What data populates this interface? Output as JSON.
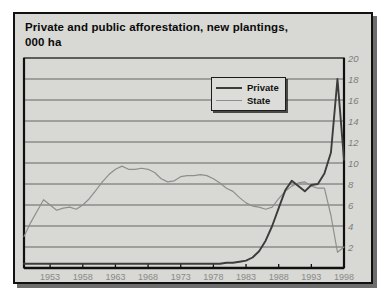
{
  "chart_title": "Private and public afforestation, new plantings,\n000 ha",
  "legend": {
    "position": "inside-top-center",
    "items": [
      {
        "label": "Private",
        "color": "#3c3c3c"
      },
      {
        "label": "State",
        "color": "#8e8e8e"
      }
    ]
  },
  "axes": {
    "y_ticks": [
      "2",
      "4",
      "6",
      "8",
      "10",
      "12",
      "14",
      "16",
      "18",
      "20"
    ],
    "x_ticks": [
      "1953",
      "1958",
      "1963",
      "1968",
      "1973",
      "1978",
      "1983",
      "1988",
      "1993",
      "1998"
    ]
  },
  "chart_data": {
    "type": "line",
    "title": "Private and public afforestation, new plantings, 000 ha",
    "xlabel": "",
    "ylabel": "000 ha",
    "xlim": [
      1949,
      1998
    ],
    "ylim": [
      0,
      20
    ],
    "grid": true,
    "legend_position": "inside-top-center",
    "x": [
      1949,
      1950,
      1951,
      1952,
      1953,
      1954,
      1955,
      1956,
      1957,
      1958,
      1959,
      1960,
      1961,
      1962,
      1963,
      1964,
      1965,
      1966,
      1967,
      1968,
      1969,
      1970,
      1971,
      1972,
      1973,
      1974,
      1975,
      1976,
      1977,
      1978,
      1979,
      1980,
      1981,
      1982,
      1983,
      1984,
      1985,
      1986,
      1987,
      1988,
      1989,
      1990,
      1991,
      1992,
      1993,
      1994,
      1995,
      1996,
      1997,
      1998
    ],
    "series": [
      {
        "name": "State",
        "color": "#8e8e8e",
        "values": [
          3.0,
          4.3,
          5.4,
          6.5,
          6.0,
          5.5,
          5.7,
          5.8,
          5.6,
          6.0,
          6.6,
          7.4,
          8.2,
          8.9,
          9.4,
          9.7,
          9.4,
          9.4,
          9.5,
          9.4,
          9.1,
          8.5,
          8.2,
          8.3,
          8.7,
          8.8,
          8.8,
          8.9,
          8.8,
          8.5,
          8.1,
          7.6,
          7.3,
          6.7,
          6.2,
          5.9,
          5.8,
          5.6,
          5.8,
          6.6,
          7.3,
          7.8,
          8.1,
          8.2,
          7.8,
          7.6,
          7.6,
          7.5,
          7.0,
          6.0
        ]
      },
      {
        "name": "Private",
        "color": "#3c3c3c",
        "values": [
          0.4,
          0.4,
          0.4,
          0.4,
          0.4,
          0.4,
          0.4,
          0.4,
          0.4,
          0.4,
          0.4,
          0.4,
          0.4,
          0.4,
          0.4,
          0.4,
          0.4,
          0.4,
          0.4,
          0.4,
          0.4,
          0.4,
          0.4,
          0.4,
          0.4,
          0.4,
          0.4,
          0.4,
          0.4,
          0.4,
          0.4,
          0.5,
          0.5,
          0.6,
          0.7,
          1.0,
          1.6,
          2.6,
          4.0,
          5.7,
          7.4,
          8.3,
          7.8,
          7.3,
          7.9,
          8.0,
          9.0,
          11.0,
          18.0,
          10.3
        ]
      }
    ],
    "series_tail": {
      "State_1995_1998": [
        7.6,
        5.0,
        1.5,
        2.0
      ]
    }
  }
}
